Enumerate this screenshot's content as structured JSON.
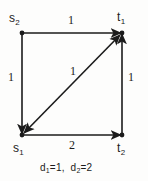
{
  "figure": {
    "kind": "directed-graph-diagram",
    "background_color": "#fdfdfc",
    "ink_color": "#1b1b1b",
    "caption": "d₁=1,  d₂=2",
    "caption_parts": {
      "d1_name": "d",
      "d1_sub": "1",
      "d1_value": "=1,",
      "d2_name": "d",
      "d2_sub": "2",
      "d2_value": "=2"
    }
  },
  "nodes": [
    {
      "id": "s2",
      "name": "s",
      "subscript": "2",
      "label": "s₂",
      "x": 22,
      "y": 33
    },
    {
      "id": "t1",
      "name": "t",
      "subscript": "1",
      "label": "t₁",
      "x": 122,
      "y": 33
    },
    {
      "id": "s1",
      "name": "s",
      "subscript": "1",
      "label": "s₁",
      "x": 22,
      "y": 135
    },
    {
      "id": "t2",
      "name": "t",
      "subscript": "2",
      "label": "t₂",
      "x": 122,
      "y": 135
    }
  ],
  "edges": [
    {
      "id": "top",
      "from": "s2",
      "to": "t1",
      "weight": "1",
      "direction": "one-way"
    },
    {
      "id": "left",
      "from": "s2",
      "to": "s1",
      "weight": "1",
      "direction": "one-way"
    },
    {
      "id": "bottom",
      "from": "s1",
      "to": "t2",
      "weight": "2",
      "direction": "one-way"
    },
    {
      "id": "right",
      "from": "t2",
      "to": "t1",
      "weight": "1",
      "direction": "one-way"
    },
    {
      "id": "diagonal",
      "from": "s1",
      "to": "t1",
      "weight": "1",
      "direction": "two-way"
    }
  ]
}
